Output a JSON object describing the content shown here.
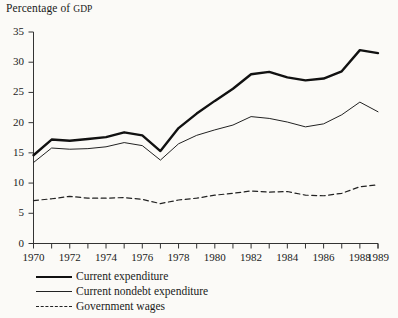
{
  "figure": {
    "axis_title": "Percentage of GDP",
    "axis_title_main": "Percentage of ",
    "axis_title_smallcaps": "GDP"
  },
  "legend": {
    "items": [
      {
        "label": "Current expenditure",
        "style": "thick-solid",
        "color": "#111111"
      },
      {
        "label": "Current nondebt expenditure",
        "style": "thin-solid",
        "color": "#222222"
      },
      {
        "label": "Government wages",
        "style": "dashed",
        "color": "#222222"
      }
    ]
  },
  "axes": {
    "y_ticks": [
      "0",
      "5",
      "10",
      "15",
      "20",
      "25",
      "30",
      "35"
    ],
    "x_ticks": [
      "1970",
      "1972",
      "1974",
      "1976",
      "1978",
      "1980",
      "1982",
      "1984",
      "1986",
      "1988",
      "1989"
    ]
  },
  "chart_data": {
    "type": "line",
    "title": "Percentage of GDP",
    "xlabel": "",
    "ylabel": "Percentage of GDP",
    "xlim": [
      1970,
      1989
    ],
    "ylim": [
      0,
      35
    ],
    "ytick_step": 5,
    "grid": false,
    "legend_position": "below-left",
    "x": [
      1970,
      1971,
      1972,
      1973,
      1974,
      1975,
      1976,
      1977,
      1978,
      1979,
      1980,
      1981,
      1982,
      1983,
      1984,
      1985,
      1986,
      1987,
      1988,
      1989
    ],
    "series": [
      {
        "name": "Current expenditure",
        "style": "thick-solid",
        "color": "#111111",
        "values": [
          14.6,
          17.2,
          17.0,
          17.3,
          17.6,
          18.4,
          17.9,
          15.3,
          19.1,
          21.5,
          23.6,
          25.6,
          28.0,
          28.4,
          27.5,
          27.0,
          27.3,
          28.5,
          32.0,
          31.5
        ]
      },
      {
        "name": "Current nondebt expenditure",
        "style": "thin-solid",
        "color": "#222222",
        "values": [
          13.4,
          15.8,
          15.6,
          15.7,
          16.0,
          16.7,
          16.2,
          13.8,
          16.5,
          17.9,
          18.8,
          19.6,
          21.0,
          20.7,
          20.1,
          19.3,
          19.8,
          21.3,
          23.4,
          21.8
        ]
      },
      {
        "name": "Government wages",
        "style": "dashed",
        "color": "#222222",
        "values": [
          7.1,
          7.4,
          7.8,
          7.5,
          7.5,
          7.6,
          7.3,
          6.6,
          7.2,
          7.5,
          8.0,
          8.3,
          8.7,
          8.5,
          8.6,
          8.0,
          7.9,
          8.3,
          9.4,
          9.7
        ]
      }
    ]
  }
}
